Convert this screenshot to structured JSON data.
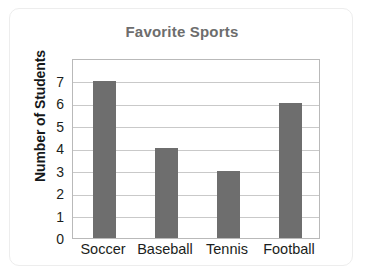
{
  "card": {
    "border_color": "#ededed",
    "background": "#ffffff"
  },
  "chart_data": {
    "type": "bar",
    "title": "Favorite Sports",
    "xlabel": "",
    "ylabel": "Number of Students",
    "categories": [
      "Soccer",
      "Baseball",
      "Tennis",
      "Football"
    ],
    "values": [
      7,
      4,
      3,
      6
    ],
    "ylim": [
      0,
      8
    ],
    "y_ticks": [
      0,
      1,
      2,
      3,
      4,
      5,
      6,
      7
    ],
    "y_tick_labels": [
      "0",
      "1",
      "2",
      "3",
      "4",
      "5",
      "6",
      "7"
    ],
    "grid": true,
    "grid_axis": "y",
    "legend": false,
    "bar_color": "#6e6e6e",
    "title_color": "#6d6d6d",
    "axis_label_color": "#15181a",
    "tick_label_color": "#1b1e20",
    "grid_color": "#c9c9c9",
    "plot_border_color": "#b9b9b9"
  }
}
